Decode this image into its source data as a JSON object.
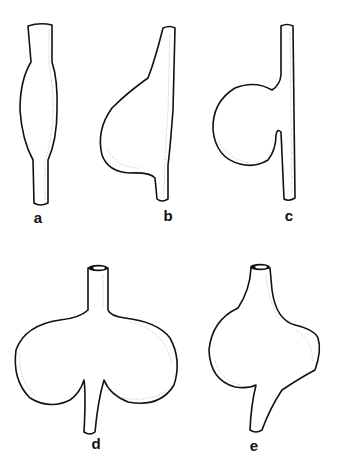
{
  "figure": {
    "panels": [
      {
        "id": "a",
        "label": "a",
        "description": "fusiform dilation"
      },
      {
        "id": "b",
        "label": "b",
        "description": "eccentric saccular dilation"
      },
      {
        "id": "c",
        "label": "c",
        "description": "saccular side aneurysm with narrow neck"
      },
      {
        "id": "d",
        "label": "d",
        "description": "bilobed (kidney-shaped) sac"
      },
      {
        "id": "e",
        "label": "e",
        "description": "irregular saccular dilation with spur outlet"
      }
    ],
    "colors": {
      "line": "#111111",
      "shading": "#9a9a9a",
      "background": "#ffffff"
    }
  }
}
